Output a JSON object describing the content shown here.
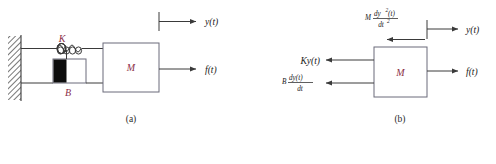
{
  "figure": {
    "captions": {
      "a": "(a)",
      "b": "(b)"
    },
    "colors": {
      "symbol": "#8c2f48",
      "line": "#3a3a3a",
      "box_border": "#6b6b7a",
      "background": "#ffffff",
      "text": "#1a1a1a"
    }
  },
  "panel_a": {
    "caption": "(a)",
    "mass_label": "M",
    "spring_label": "K",
    "damper_label": "B",
    "displacement_label": "y(t)",
    "force_label": "f(t)",
    "elements": {
      "wall": "fixed-hatched-wall",
      "spring": "coil-spring",
      "damper": "dashpot",
      "mass_block": "mass-M"
    }
  },
  "panel_b": {
    "caption": "(b)",
    "mass_label": "M",
    "displacement_label": "y(t)",
    "force_label": "f(t)",
    "inertia_force": {
      "coefficient": "M",
      "numerator": "dy",
      "numerator_sup": "2",
      "numerator_arg": "(t)",
      "denominator": "dt",
      "denominator_sup": "2",
      "plain": "M dy2(t)/dt2"
    },
    "spring_force": {
      "plain": "Ky(t)",
      "coefficient": "K",
      "variable": "y(t)"
    },
    "damping_force": {
      "coefficient": "B",
      "numerator": "dy(t)",
      "denominator": "dt",
      "plain": "B dy(t)/dt"
    }
  }
}
